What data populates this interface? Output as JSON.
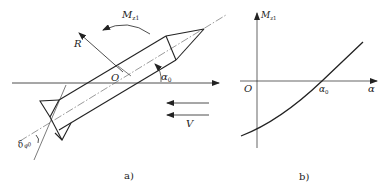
{
  "figure": {
    "panel_a": {
      "caption": "a)",
      "labels": {
        "moment": "M",
        "moment_sub": "z1",
        "force": "R",
        "origin": "O",
        "angle": "α",
        "angle_sub": "0",
        "velocity": "V",
        "deflection": "δ",
        "deflection_sub": "φ0"
      }
    },
    "panel_b": {
      "caption": "b)",
      "labels": {
        "y_axis": "M",
        "y_axis_sub": "z1",
        "x_axis": "α",
        "origin": "O",
        "zero_crossing": "α",
        "zero_crossing_sub": "0"
      }
    },
    "colors": {
      "line": "#222222",
      "centerline": "#555555"
    }
  }
}
